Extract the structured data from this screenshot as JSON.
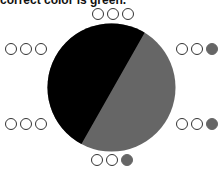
{
  "caption": "correct color is green.",
  "pie": {
    "colors": {
      "left": "#000000",
      "right": "#666666"
    }
  },
  "peg_rows": {
    "top": [
      "empty",
      "empty",
      "empty"
    ],
    "left_upper": [
      "empty",
      "empty",
      "empty"
    ],
    "right_upper": [
      "empty",
      "empty",
      "filled"
    ],
    "left_lower": [
      "empty",
      "empty",
      "empty"
    ],
    "right_lower": [
      "empty",
      "empty",
      "filled"
    ],
    "bottom": [
      "empty",
      "empty",
      "filled"
    ]
  },
  "colors": {
    "outline": "#333333",
    "filled": "#666666",
    "background": "#ffffff"
  }
}
